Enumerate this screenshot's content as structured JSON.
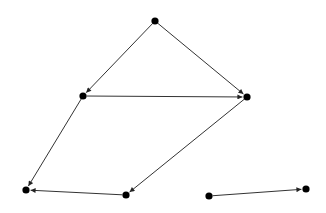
{
  "diagram": {
    "type": "directed-graph",
    "background": "#ffffff",
    "node_color": "#000000",
    "edge_color": "#333333",
    "node_radius": 3.6,
    "nodes": [
      {
        "id": "n1",
        "x": 155,
        "y": 21
      },
      {
        "id": "n2",
        "x": 83,
        "y": 96
      },
      {
        "id": "n3",
        "x": 247,
        "y": 97
      },
      {
        "id": "n4",
        "x": 26,
        "y": 190
      },
      {
        "id": "n5",
        "x": 126,
        "y": 195
      },
      {
        "id": "n6",
        "x": 209,
        "y": 196
      },
      {
        "id": "n7",
        "x": 306,
        "y": 189
      }
    ],
    "edges": [
      {
        "from": "n1",
        "to": "n2"
      },
      {
        "from": "n1",
        "to": "n3"
      },
      {
        "from": "n2",
        "to": "n3"
      },
      {
        "from": "n2",
        "to": "n4"
      },
      {
        "from": "n3",
        "to": "n5"
      },
      {
        "from": "n5",
        "to": "n4"
      },
      {
        "from": "n6",
        "to": "n7"
      }
    ]
  }
}
